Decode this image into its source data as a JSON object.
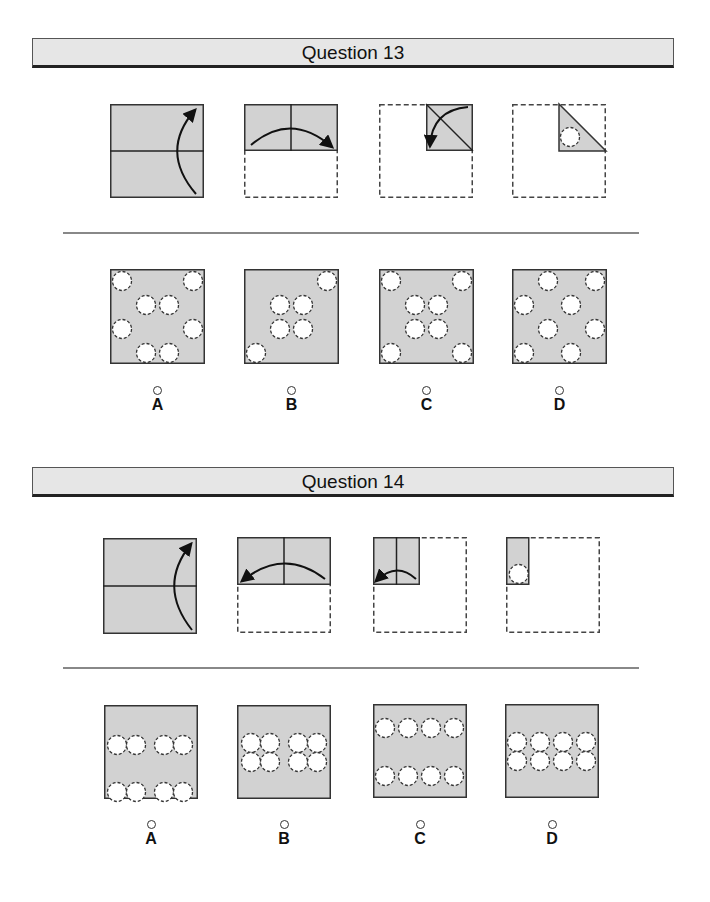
{
  "colors": {
    "paper": "#d2d2d2",
    "stroke": "#333333",
    "hole": "#ffffff",
    "header_bg": "#e6e6e6"
  },
  "questions": [
    {
      "title": "Question 13",
      "header_y": 38,
      "divider_y": 232,
      "folding_steps": [
        {
          "x": 110,
          "y": 104,
          "w": 94,
          "h": 94,
          "type": "q13-step1"
        },
        {
          "x": 244,
          "y": 104,
          "w": 94,
          "h": 94,
          "type": "q13-step2"
        },
        {
          "x": 379,
          "y": 104,
          "w": 94,
          "h": 94,
          "type": "q13-step3"
        },
        {
          "x": 512,
          "y": 104,
          "w": 94,
          "h": 94,
          "type": "q13-step4"
        }
      ],
      "options": [
        {
          "letter": "A",
          "x": 110,
          "y": 269,
          "size": 95,
          "holes": [
            [
              12,
              12
            ],
            [
              83,
              12
            ],
            [
              36,
              36
            ],
            [
              59,
              36
            ],
            [
              12,
              60
            ],
            [
              83,
              60
            ],
            [
              36,
              84
            ],
            [
              59,
              84
            ]
          ]
        },
        {
          "letter": "B",
          "x": 244,
          "y": 269,
          "size": 95,
          "holes": [
            [
              83,
              12
            ],
            [
              36,
              36
            ],
            [
              59,
              36
            ],
            [
              36,
              60
            ],
            [
              59,
              60
            ],
            [
              12,
              84
            ]
          ]
        },
        {
          "letter": "C",
          "x": 379,
          "y": 269,
          "size": 95,
          "holes": [
            [
              12,
              12
            ],
            [
              83,
              12
            ],
            [
              36,
              36
            ],
            [
              59,
              36
            ],
            [
              36,
              60
            ],
            [
              59,
              60
            ],
            [
              12,
              84
            ],
            [
              83,
              84
            ]
          ]
        },
        {
          "letter": "D",
          "x": 512,
          "y": 269,
          "size": 95,
          "holes": [
            [
              36,
              12
            ],
            [
              83,
              12
            ],
            [
              12,
              36
            ],
            [
              59,
              36
            ],
            [
              36,
              60
            ],
            [
              83,
              60
            ],
            [
              12,
              84
            ],
            [
              59,
              84
            ]
          ]
        }
      ],
      "option_label_y": 386
    },
    {
      "title": "Question 14",
      "header_y": 467,
      "divider_y": 667,
      "folding_steps": [
        {
          "x": 103,
          "y": 538,
          "w": 94,
          "h": 96,
          "type": "q14-step1"
        },
        {
          "x": 237,
          "y": 537,
          "w": 94,
          "h": 96,
          "type": "q14-step2"
        },
        {
          "x": 373,
          "y": 537,
          "w": 94,
          "h": 96,
          "type": "q14-step3"
        },
        {
          "x": 506,
          "y": 537,
          "w": 94,
          "h": 96,
          "type": "q14-step4"
        }
      ],
      "options": [
        {
          "letter": "A",
          "x": 104,
          "y": 705,
          "size": 94,
          "holes": [
            [
              13,
              40
            ],
            [
              32,
              40
            ],
            [
              60,
              40
            ],
            [
              79,
              40
            ],
            [
              13,
              87
            ],
            [
              32,
              87
            ],
            [
              60,
              87
            ],
            [
              79,
              87
            ]
          ]
        },
        {
          "letter": "B",
          "x": 237,
          "y": 705,
          "size": 94,
          "holes": [
            [
              14,
              38
            ],
            [
              33,
              38
            ],
            [
              14,
              57
            ],
            [
              33,
              57
            ],
            [
              61,
              38
            ],
            [
              80,
              38
            ],
            [
              61,
              57
            ],
            [
              80,
              57
            ]
          ]
        },
        {
          "letter": "C",
          "x": 373,
          "y": 704,
          "size": 94,
          "holes": [
            [
              12,
              24
            ],
            [
              35,
              24
            ],
            [
              58,
              24
            ],
            [
              81,
              24
            ],
            [
              12,
              72
            ],
            [
              35,
              72
            ],
            [
              58,
              72
            ],
            [
              81,
              72
            ]
          ]
        },
        {
          "letter": "D",
          "x": 505,
          "y": 704,
          "size": 94,
          "holes": [
            [
              12,
              38
            ],
            [
              35,
              38
            ],
            [
              58,
              38
            ],
            [
              81,
              38
            ],
            [
              12,
              57
            ],
            [
              35,
              57
            ],
            [
              58,
              57
            ],
            [
              81,
              57
            ]
          ]
        }
      ],
      "option_label_y": 820
    }
  ]
}
